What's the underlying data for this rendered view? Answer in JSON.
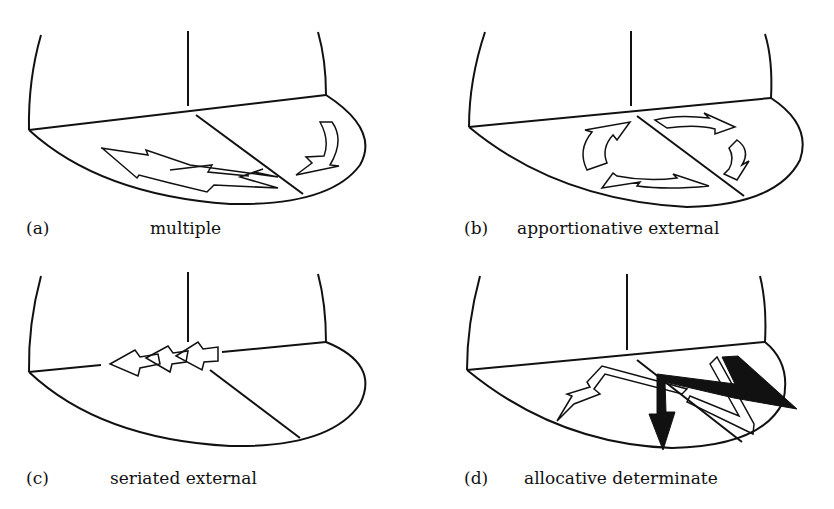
{
  "figure": {
    "panels": [
      {
        "letter": "(a)",
        "name": "multiple"
      },
      {
        "letter": "(b)",
        "name": "apportionative external"
      },
      {
        "letter": "(c)",
        "name": "seriated external"
      },
      {
        "letter": "(d)",
        "name": "allocative determinate"
      }
    ],
    "colors": {
      "ink": "#111111",
      "paper": "#ffffff"
    }
  }
}
